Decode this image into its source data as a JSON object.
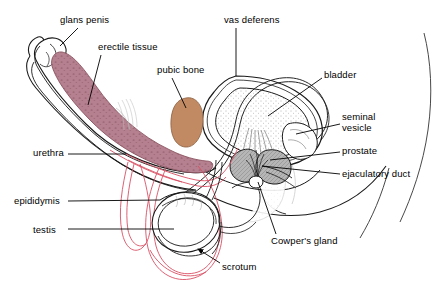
{
  "diagram": {
    "type": "anatomical-cross-section",
    "background_color": "#ffffff",
    "palette": {
      "outline": "#1a1a1a",
      "erectile_tissue": "#b5808f",
      "erectile_tissue_speckle": "#7d4a58",
      "pubic_bone": "#c28a63",
      "gland_gray": "#a9a9a9",
      "scrotum_line": "#d94f63",
      "urethra_line": "#d94f63",
      "bladder_fill": "#ffffff",
      "label_text": "#000000"
    },
    "labels": [
      {
        "id": "glans-penis",
        "text": "glans penis",
        "x": 60,
        "y": 14,
        "align": "left",
        "leader": {
          "from": [
            78,
            28
          ],
          "to": [
            60,
            46
          ],
          "arrow": false
        }
      },
      {
        "id": "erectile-tissue",
        "text": "erectile tissue",
        "x": 98,
        "y": 41,
        "align": "left",
        "leader": {
          "from": [
            101,
            55
          ],
          "to": [
            88,
            105
          ],
          "arrow": false
        }
      },
      {
        "id": "pubic-bone",
        "text": "pubic bone",
        "x": 157,
        "y": 64,
        "align": "left",
        "leader": {
          "from": [
            172,
            78
          ],
          "to": [
            186,
            108
          ],
          "arrow": false
        }
      },
      {
        "id": "vas-deferens",
        "text": "vas deferens",
        "x": 224,
        "y": 14,
        "align": "left",
        "leader": {
          "from": [
            236,
            28
          ],
          "to": [
            236,
            76
          ],
          "arrow": false
        }
      },
      {
        "id": "bladder",
        "text": "bladder",
        "x": 324,
        "y": 69,
        "align": "left",
        "leader": {
          "from": [
            322,
            78
          ],
          "to": [
            268,
            116
          ],
          "arrow": false
        }
      },
      {
        "id": "seminal-vesicle",
        "text": "seminal\nvesicle",
        "x": 342,
        "y": 111,
        "align": "left",
        "leader": {
          "from": [
            340,
            124
          ],
          "to": [
            296,
            134
          ],
          "arrow": false
        }
      },
      {
        "id": "prostate",
        "text": "prostate",
        "x": 342,
        "y": 145,
        "align": "left",
        "leader": {
          "from": [
            340,
            152
          ],
          "to": [
            270,
            160
          ],
          "arrow": false
        }
      },
      {
        "id": "ejaculatory-duct",
        "text": "ejaculatory duct",
        "x": 342,
        "y": 168,
        "align": "left",
        "leader": {
          "from": [
            340,
            174
          ],
          "to": [
            262,
            166
          ],
          "arrow": false
        }
      },
      {
        "id": "urethra",
        "text": "urethra",
        "x": 33,
        "y": 147,
        "align": "left",
        "leader": {
          "from": [
            68,
            154
          ],
          "to": [
            126,
            154
          ],
          "arrow": false
        }
      },
      {
        "id": "epididymis",
        "text": "epididymis",
        "x": 14,
        "y": 195,
        "align": "left",
        "leader": {
          "from": [
            68,
            201
          ],
          "to": [
            160,
            200
          ],
          "arrow": false
        }
      },
      {
        "id": "testis",
        "text": "testis",
        "x": 33,
        "y": 224,
        "align": "left",
        "leader": {
          "from": [
            68,
            229
          ],
          "to": [
            174,
            229
          ],
          "arrow": false
        }
      },
      {
        "id": "cowpers-gland",
        "text": "Cowper's gland",
        "x": 271,
        "y": 235,
        "align": "left",
        "leader": {
          "from": [
            276,
            234
          ],
          "to": [
            258,
            182
          ],
          "arrow": false
        }
      },
      {
        "id": "scrotum",
        "text": "scrotum",
        "x": 222,
        "y": 261,
        "align": "left",
        "leader": {
          "from": [
            220,
            263
          ],
          "to": [
            196,
            248
          ],
          "arrow": true
        }
      }
    ],
    "structures": [
      {
        "id": "penis-shaft",
        "label": "penis shaft outline",
        "fill": "none"
      },
      {
        "id": "erectile-tissue-body",
        "label": "erectile tissue (corpus cavernosum)",
        "fill": "#b5808f"
      },
      {
        "id": "glans",
        "label": "glans penis",
        "fill": "none"
      },
      {
        "id": "urethra-channel",
        "label": "urethra",
        "fill": "none"
      },
      {
        "id": "pubic-bone-body",
        "label": "pubic bone",
        "fill": "#c28a63"
      },
      {
        "id": "bladder-body",
        "label": "bladder",
        "fill": "#ffffff"
      },
      {
        "id": "prostate-body",
        "label": "prostate",
        "fill": "#a9a9a9"
      },
      {
        "id": "seminal-vesicle-body",
        "label": "seminal vesicle",
        "fill": "#a9a9a9"
      },
      {
        "id": "cowpers-gland-body",
        "label": "Cowper's gland",
        "fill": "#ffffff"
      },
      {
        "id": "testis-body",
        "label": "testis",
        "fill": "none"
      },
      {
        "id": "epididymis-body",
        "label": "epididymis",
        "fill": "none"
      },
      {
        "id": "scrotum-body",
        "label": "scrotum",
        "fill": "none"
      },
      {
        "id": "vas-deferens-duct",
        "label": "vas deferens",
        "fill": "none"
      },
      {
        "id": "body-contour",
        "label": "body contour (buttock)",
        "fill": "none"
      }
    ]
  }
}
